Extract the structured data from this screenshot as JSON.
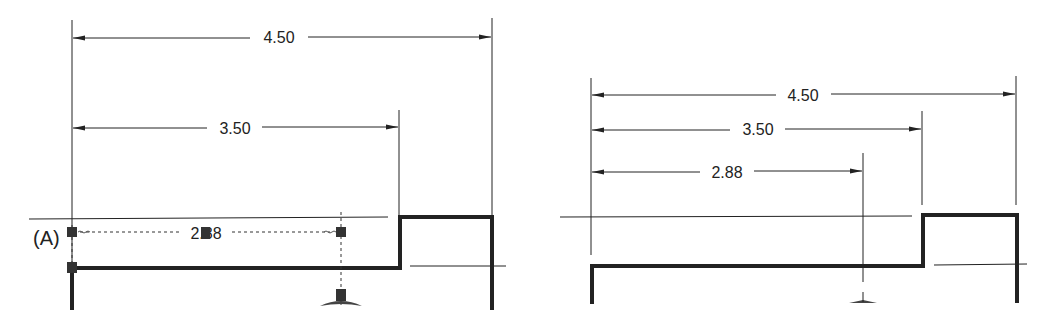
{
  "left_drawing": {
    "dimensions": [
      {
        "label": "4.50",
        "name": "overall-width"
      },
      {
        "label": "3.50",
        "name": "step-width"
      },
      {
        "label": "2.88",
        "name": "in-progress-dimension"
      }
    ],
    "point_label": "(A)",
    "state": "placing dimension with grips"
  },
  "right_drawing": {
    "dimensions": [
      {
        "label": "4.50",
        "name": "overall-width"
      },
      {
        "label": "3.50",
        "name": "step-width"
      },
      {
        "label": "2.88",
        "name": "placed-dimension"
      }
    ],
    "state": "completed dimensions"
  },
  "colors": {
    "line": "#222222",
    "background": "#ffffff",
    "grip": "#333333"
  }
}
